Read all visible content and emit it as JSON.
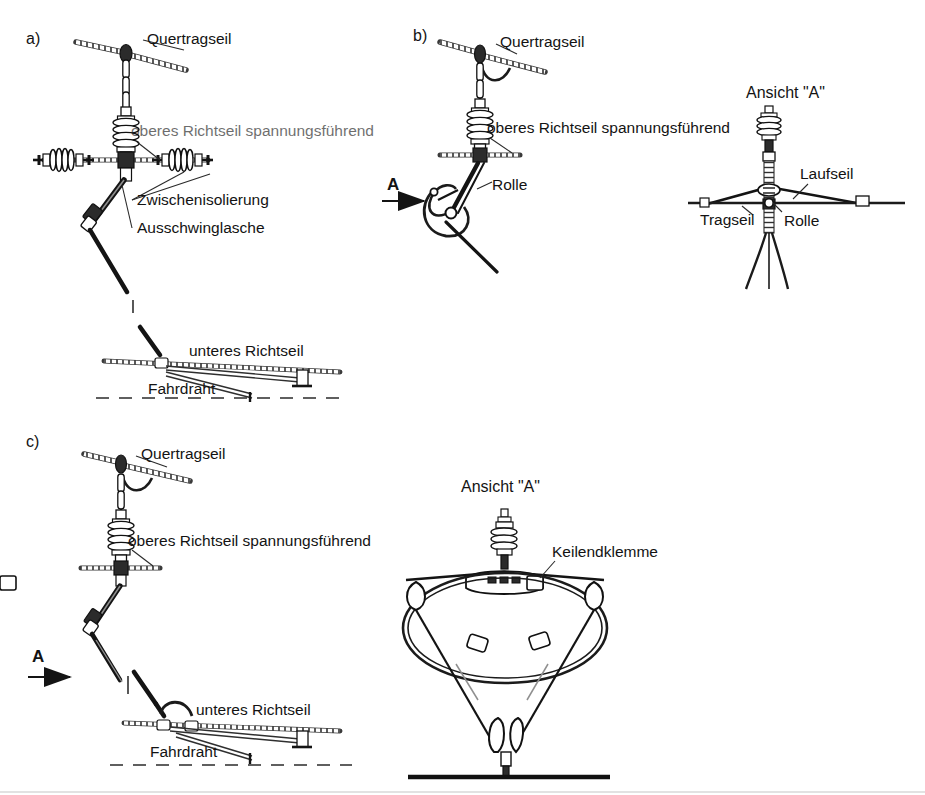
{
  "figure": {
    "title_absent": true,
    "background": "#ffffff",
    "ink_color": "#131313",
    "panels": [
      {
        "id": "a",
        "key": "a)",
        "labels": [
          {
            "name": "quertragseil",
            "text": "Quertragseil"
          },
          {
            "name": "oberes-richtseil",
            "text": "oberes Richtseil spannungsführend",
            "blurred": true
          },
          {
            "name": "zwischenisolierung",
            "text": "Zwischenisolierung"
          },
          {
            "name": "ausschwinglasche",
            "text": "Ausschwinglasche"
          },
          {
            "name": "unteres-richtseil",
            "text": "unteres Richtseil"
          },
          {
            "name": "fahrdraht",
            "text": "Fahrdraht"
          }
        ]
      },
      {
        "id": "b",
        "key": "b)",
        "view_arrow": "A",
        "labels": [
          {
            "name": "quertragseil",
            "text": "Quertragseil"
          },
          {
            "name": "oberes-richtseil",
            "text": "oberes Richtseil spannungsführend"
          },
          {
            "name": "rolle",
            "text": "Rolle"
          }
        ],
        "detail": {
          "name": "ansicht-a-b",
          "title": "Ansicht \"A\"",
          "labels": [
            {
              "name": "laufseil",
              "text": "Laufseil"
            },
            {
              "name": "tragseil",
              "text": "Tragseil"
            },
            {
              "name": "rolle",
              "text": "Rolle"
            }
          ]
        }
      },
      {
        "id": "c",
        "key": "c)",
        "view_arrow": "A",
        "labels": [
          {
            "name": "quertragseil",
            "text": "Quertragseil"
          },
          {
            "name": "oberes-richtseil",
            "text": "oberes Richtseil spannungsführend"
          },
          {
            "name": "unteres-richtseil",
            "text": "unteres Richtseil"
          },
          {
            "name": "fahrdraht",
            "text": "Fahrdraht"
          }
        ],
        "detail": {
          "name": "ansicht-a-c",
          "title": "Ansicht \"A\"",
          "labels": [
            {
              "name": "keilendklemme",
              "text": "Keilendklemme"
            }
          ]
        }
      }
    ]
  }
}
